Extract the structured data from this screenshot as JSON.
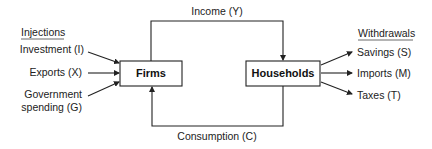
{
  "diagram": {
    "nodes": {
      "firms": "Firms",
      "households": "Households"
    },
    "flows": {
      "income": "Income (Y)",
      "consumption": "Consumption (C)"
    },
    "injections": {
      "heading": "Injections",
      "items": [
        "Investment (I)",
        "Exports (X)",
        "Government",
        "spending (G)"
      ]
    },
    "withdrawals": {
      "heading": "Withdrawals",
      "items": [
        "Savings (S)",
        "Imports (M)",
        "Taxes (T)"
      ]
    },
    "colors": {
      "stroke": "#222222",
      "background": "#ffffff"
    }
  }
}
